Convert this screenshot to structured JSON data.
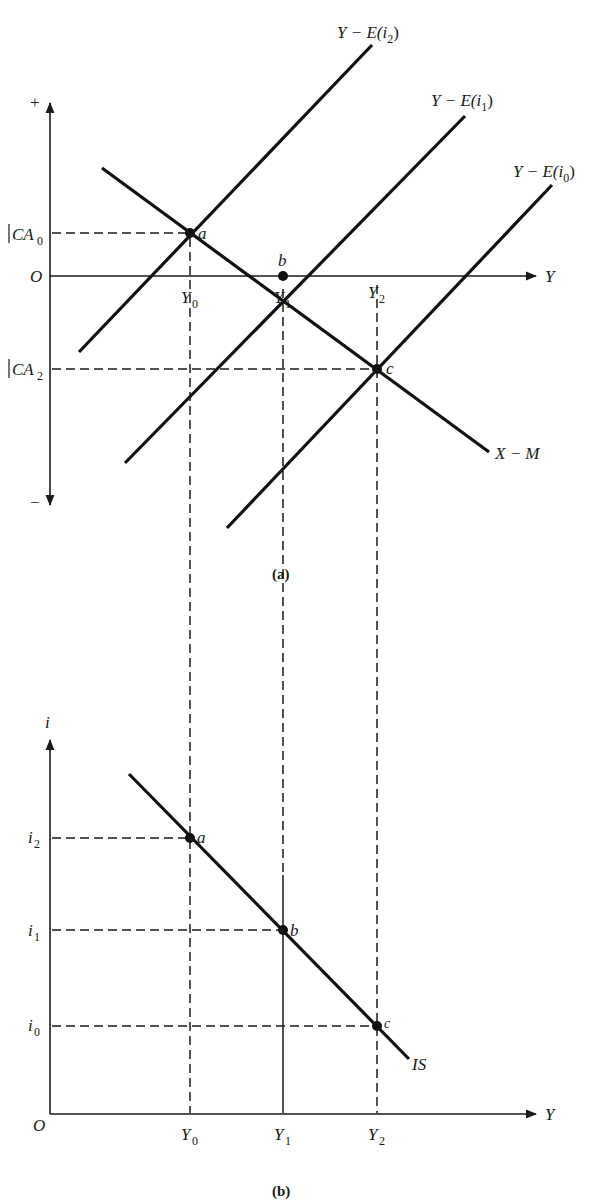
{
  "panel_a": {
    "caption": "(a)",
    "y_axis": {
      "top_label": "+",
      "bottom_label": "−",
      "origin": "O"
    },
    "x_axis": {
      "label": "Y"
    },
    "y_ticks": [
      {
        "label": "CA",
        "sub": "0"
      },
      {
        "label": "CA",
        "sub": "2"
      }
    ],
    "x_ticks": [
      {
        "label": "Y",
        "sub": "0"
      },
      {
        "label": "Y",
        "sub": "1"
      },
      {
        "label": "Y",
        "sub": "2"
      }
    ],
    "curves": [
      {
        "label": "Y − E(i",
        "sub": "2",
        "close": ")"
      },
      {
        "label": "Y − E(i",
        "sub": "1",
        "close": ")"
      },
      {
        "label": "Y − E(i",
        "sub": "0",
        "close": ")"
      },
      {
        "label": "X − M"
      }
    ],
    "points": [
      "a",
      "b",
      "c"
    ]
  },
  "panel_b": {
    "caption": "(b)",
    "y_axis": {
      "label": "i",
      "origin": "O"
    },
    "x_axis": {
      "label": "Y"
    },
    "y_ticks": [
      {
        "label": "i",
        "sub": "2"
      },
      {
        "label": "i",
        "sub": "1"
      },
      {
        "label": "i",
        "sub": "0"
      }
    ],
    "x_ticks": [
      {
        "label": "Y",
        "sub": "0"
      },
      {
        "label": "Y",
        "sub": "1"
      },
      {
        "label": "Y",
        "sub": "2"
      }
    ],
    "curve": {
      "label": "IS"
    },
    "points": [
      "a",
      "b",
      "c"
    ]
  }
}
